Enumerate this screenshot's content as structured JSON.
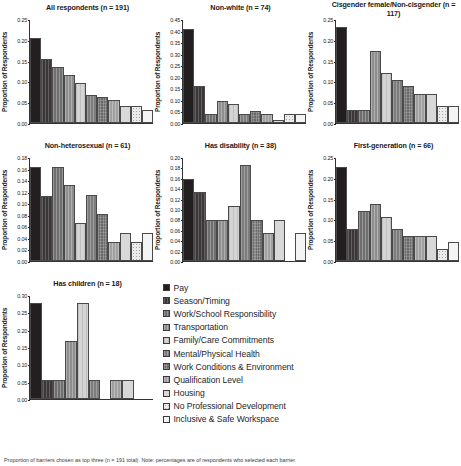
{
  "figure": {
    "ylabel": "Proportion of Respondents",
    "caption": "Proportion of barriers chosen as top three (n = 191 total). Note: percentages are of respondents who selected each barrier."
  },
  "categories": [
    "Pay",
    "Season/Timing",
    "Work/School Responsibility",
    "Transportation",
    "Family/Care Commitments",
    "Mental/Physical Health",
    "Work Conditions & Environment",
    "Qualification Level",
    "Housing",
    "No Professional Development",
    "Inclusive & Safe Workspace"
  ],
  "legend": {
    "items": [
      {
        "label": "Pay",
        "swatch": "f0"
      },
      {
        "label": "Season/Timing",
        "swatch": "f1"
      },
      {
        "label": "Work/School Responsibility",
        "swatch": "f2"
      },
      {
        "label": "Transportation",
        "swatch": "f3"
      },
      {
        "label": "Family/Care Commitments",
        "swatch": "f4"
      },
      {
        "label": "Mental/Physical Health",
        "swatch": "f5"
      },
      {
        "label": "Work Conditions & Environment",
        "swatch": "f6"
      },
      {
        "label": "Qualification Level",
        "swatch": "f7"
      },
      {
        "label": "Housing",
        "swatch": "f8"
      },
      {
        "label": "No Professional Development",
        "swatch": "f9"
      },
      {
        "label": "Inclusive & Safe Workspace",
        "swatch": "f10"
      }
    ]
  },
  "chart_data": [
    {
      "type": "bar",
      "title": "All respondents (n = 191)",
      "xlabel": "",
      "ylabel": "Proportion of Respondents",
      "ylim": [
        0,
        0.25
      ],
      "yticks": [
        "0.00",
        "0.05",
        "0.10",
        "0.15",
        "0.20",
        "0.25"
      ],
      "categories": [
        "Pay",
        "Season/Timing",
        "Work/School Responsibility",
        "Transportation",
        "Family/Care Commitments",
        "Mental/Physical Health",
        "Work Conditions & Environment",
        "Qualification Level",
        "Housing",
        "No Professional Development",
        "Inclusive & Safe Workspace"
      ],
      "values": [
        0.205,
        0.155,
        0.135,
        0.115,
        0.095,
        0.068,
        0.062,
        0.055,
        0.042,
        0.042,
        0.032
      ]
    },
    {
      "type": "bar",
      "title": "Non-white (n = 74)",
      "xlabel": "",
      "ylabel": "Proportion of Respondents",
      "ylim": [
        0,
        0.45
      ],
      "yticks": [
        "0.00",
        "0.05",
        "0.10",
        "0.15",
        "0.20",
        "0.25",
        "0.30",
        "0.35",
        "0.40",
        "0.45"
      ],
      "categories": [
        "Pay",
        "Season/Timing",
        "Work/School Responsibility",
        "Transportation",
        "Family/Care Commitments",
        "Mental/Physical Health",
        "Work Conditions & Environment",
        "Qualification Level",
        "Housing",
        "No Professional Development",
        "Inclusive & Safe Workspace"
      ],
      "values": [
        0.405,
        0.16,
        0.038,
        0.095,
        0.082,
        0.038,
        0.052,
        0.038,
        0.012,
        0.038,
        0.038
      ]
    },
    {
      "type": "bar",
      "title": "Cisgender female/Non-cisgender (n = 117)",
      "xlabel": "",
      "ylabel": "Proportion of Respondents",
      "ylim": [
        0,
        0.25
      ],
      "yticks": [
        "0.00",
        "0.05",
        "0.10",
        "0.15",
        "0.20",
        "0.25"
      ],
      "categories": [
        "Pay",
        "Season/Timing",
        "Work/School Responsibility",
        "Transportation",
        "Family/Care Commitments",
        "Mental/Physical Health",
        "Work Conditions & Environment",
        "Qualification Level",
        "Housing",
        "No Professional Development",
        "Inclusive & Safe Workspace"
      ],
      "values": [
        0.232,
        0.032,
        0.032,
        0.172,
        0.12,
        0.103,
        0.088,
        0.07,
        0.07,
        0.04,
        0.04
      ]
    },
    {
      "type": "bar",
      "title": "Non-heterosexual (n = 61)",
      "xlabel": "",
      "ylabel": "Proportion of Respondents",
      "ylim": [
        0,
        0.18
      ],
      "yticks": [
        "0.00",
        "0.02",
        "0.04",
        "0.06",
        "0.08",
        "0.10",
        "0.12",
        "0.14",
        "0.16",
        "0.18"
      ],
      "categories": [
        "Pay",
        "Season/Timing",
        "Work/School Responsibility",
        "Transportation",
        "Family/Care Commitments",
        "Mental/Physical Health",
        "Work Conditions & Environment",
        "Qualification Level",
        "Housing",
        "No Professional Development",
        "Inclusive & Safe Workspace"
      ],
      "values": [
        0.163,
        0.113,
        0.163,
        0.131,
        0.066,
        0.114,
        0.082,
        0.033,
        0.049,
        0.033,
        0.049
      ]
    },
    {
      "type": "bar",
      "title": "Has disability (n = 38)",
      "xlabel": "",
      "ylabel": "Proportion of Respondents",
      "ylim": [
        0,
        0.2
      ],
      "yticks": [
        "0.00",
        "0.02",
        "0.04",
        "0.06",
        "0.08",
        "0.10",
        "0.12",
        "0.14",
        "0.16",
        "0.18",
        "0.20"
      ],
      "categories": [
        "Pay",
        "Season/Timing",
        "Work/School Responsibility",
        "Transportation",
        "Family/Care Commitments",
        "Mental/Physical Health",
        "Work Conditions & Environment",
        "Qualification Level",
        "Housing",
        "No Professional Development",
        "Inclusive & Safe Workspace"
      ],
      "values": [
        0.158,
        0.132,
        0.079,
        0.079,
        0.105,
        0.184,
        0.079,
        0.053,
        0.079,
        0.0,
        0.053
      ]
    },
    {
      "type": "bar",
      "title": "First-generation (n = 66)",
      "xlabel": "",
      "ylabel": "Proportion of Respondents",
      "ylim": [
        0,
        0.25
      ],
      "yticks": [
        "0.00",
        "0.05",
        "0.10",
        "0.15",
        "0.20",
        "0.25"
      ],
      "categories": [
        "Pay",
        "Season/Timing",
        "Work/School Responsibility",
        "Transportation",
        "Family/Care Commitments",
        "Mental/Physical Health",
        "Work Conditions & Environment",
        "Qualification Level",
        "Housing",
        "No Professional Development",
        "Inclusive & Safe Workspace"
      ],
      "values": [
        0.227,
        0.076,
        0.121,
        0.136,
        0.106,
        0.076,
        0.061,
        0.061,
        0.061,
        0.03,
        0.045
      ]
    },
    {
      "type": "bar",
      "title": "Has children (n = 18)",
      "xlabel": "",
      "ylabel": "Proportion of Respondents",
      "ylim": [
        0,
        0.3
      ],
      "yticks": [
        "0.00",
        "0.05",
        "0.10",
        "0.15",
        "0.20",
        "0.25",
        "0.30"
      ],
      "categories": [
        "Pay",
        "Season/Timing",
        "Work/School Responsibility",
        "Transportation",
        "Family/Care Commitments",
        "Mental/Physical Health",
        "Work Conditions & Environment",
        "Qualification Level",
        "Housing",
        "No Professional Development",
        "Inclusive & Safe Workspace"
      ],
      "values": [
        0.278,
        0.055,
        0.055,
        0.167,
        0.278,
        0.055,
        0.0,
        0.055,
        0.055,
        0.0,
        0.0
      ]
    }
  ]
}
